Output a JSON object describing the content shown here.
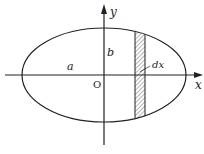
{
  "diagram": {
    "type": "ellipse-area-integration",
    "labels": {
      "y_axis": "y",
      "x_axis": "x",
      "origin": "O",
      "semi_major": "a",
      "semi_minor": "b",
      "strip_width": "dx"
    },
    "colors": {
      "stroke": "#222222",
      "background": "#ffffff",
      "hatch": "#444444"
    }
  }
}
